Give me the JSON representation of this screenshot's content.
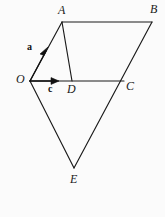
{
  "figure": {
    "name": "vector-geometry-diagram",
    "background_color": "#fbfbfb",
    "stroke_color": "#1a1a1a",
    "text_color": "#1a1a1a",
    "width": 165,
    "height": 217,
    "points": {
      "A": {
        "label": "A",
        "x": 62,
        "y": 22
      },
      "B": {
        "label": "B",
        "x": 152,
        "y": 22
      },
      "C": {
        "label": "C",
        "x": 124,
        "y": 81
      },
      "D": {
        "label": "D",
        "x": 72,
        "y": 81
      },
      "E": {
        "label": "E",
        "x": 74,
        "y": 168
      },
      "O": {
        "label": "O",
        "x": 30,
        "y": 81
      }
    },
    "segments": [
      {
        "name": "segment-AB",
        "from": "A",
        "to": "B"
      },
      {
        "name": "segment-OA",
        "from": "O",
        "to": "A"
      },
      {
        "name": "segment-AD",
        "from": "A",
        "to": "D"
      },
      {
        "name": "segment-OC",
        "from": "O",
        "to": "C"
      },
      {
        "name": "segment-BE",
        "from": "B",
        "to": "E"
      },
      {
        "name": "segment-OE",
        "from": "O",
        "to": "E"
      }
    ],
    "vectors": [
      {
        "name": "vector-a",
        "label": "a",
        "from": "O",
        "toward": "A",
        "tip_x": 47,
        "tip_y": 50
      },
      {
        "name": "vector-c",
        "label": "c",
        "from": "O",
        "toward": "D",
        "tip_x": 58,
        "tip_y": 81
      }
    ]
  }
}
